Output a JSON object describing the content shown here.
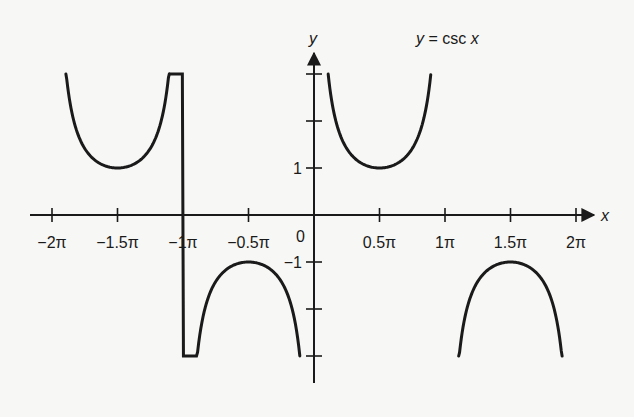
{
  "chart_data": {
    "type": "line",
    "title": "y = csc x",
    "xlabel": "x",
    "ylabel": "y",
    "origin_label": "0",
    "x_ticks": [
      {
        "value": -6.2832,
        "label": "−2π"
      },
      {
        "value": -4.7124,
        "label": "−1.5π"
      },
      {
        "value": -3.1416,
        "label": "−1π"
      },
      {
        "value": -1.5708,
        "label": "−0.5π"
      },
      {
        "value": 1.5708,
        "label": "0.5π"
      },
      {
        "value": 3.1416,
        "label": "1π"
      },
      {
        "value": 4.7124,
        "label": "1.5π"
      },
      {
        "value": 6.2832,
        "label": "2π"
      }
    ],
    "y_ticks": [
      {
        "value": 3,
        "label": ""
      },
      {
        "value": 2,
        "label": ""
      },
      {
        "value": 1,
        "label": "1"
      },
      {
        "value": -1,
        "label": "−1"
      },
      {
        "value": -2,
        "label": ""
      },
      {
        "value": -3,
        "label": ""
      }
    ],
    "xlim": [
      -6.6,
      8.5
    ],
    "ylim": [
      -3.6,
      3.5
    ],
    "grid": false,
    "legend": "none",
    "series": [
      {
        "name": "csc x branch (-2π,-π)",
        "x_range": [
          -5.95,
          -3.47
        ],
        "min_point": [
          -4.7124,
          1
        ],
        "opens": "up"
      },
      {
        "name": "csc x branch (-π,0)",
        "x_range": [
          -3.47,
          -0.34
        ],
        "max_point": [
          -1.5708,
          -1
        ],
        "opens": "down"
      },
      {
        "name": "csc x branch (0,π)",
        "x_range": [
          0.34,
          2.8
        ],
        "min_point": [
          1.5708,
          1
        ],
        "opens": "up"
      },
      {
        "name": "csc x branch (π,2π)",
        "x_range": [
          3.47,
          5.95
        ],
        "max_point": [
          4.7124,
          -1
        ],
        "opens": "down"
      }
    ],
    "y_cutoff": 3
  },
  "colors": {
    "ink": "#1a1a1a",
    "background": "#f7f7f5"
  }
}
